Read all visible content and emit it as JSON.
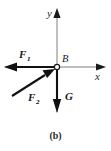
{
  "figure": {
    "caption": "(b)",
    "point_label": "B",
    "axes": {
      "x_label": "x",
      "y_label": "y",
      "x_axis_color": "#555555",
      "y_axis_color": "#777777",
      "origin": {
        "x": 57,
        "y": 67
      },
      "x_axis_end": {
        "x": 104,
        "y": 67
      },
      "y_axis_end": {
        "x": 57,
        "y": 9
      }
    },
    "vectors": [
      {
        "name": "F1",
        "label": "F",
        "subscript": "1",
        "direction": "left",
        "from": {
          "x": 57,
          "y": 67
        },
        "to": {
          "x": 5,
          "y": 67
        },
        "label_pos": {
          "x": 22,
          "y": 57
        },
        "color": "#111111"
      },
      {
        "name": "F2",
        "label": "F",
        "subscript": "2",
        "direction": "up-right",
        "from": {
          "x": 12,
          "y": 96
        },
        "to": {
          "x": 55,
          "y": 69
        },
        "label_pos": {
          "x": 31,
          "y": 99
        },
        "color": "#111111"
      },
      {
        "name": "G",
        "label": "G",
        "subscript": "",
        "direction": "down",
        "from": {
          "x": 57,
          "y": 67
        },
        "to": {
          "x": 57,
          "y": 112
        },
        "label_pos": {
          "x": 66,
          "y": 97
        },
        "color": "#111111"
      }
    ],
    "background_color": "#ffffff"
  }
}
